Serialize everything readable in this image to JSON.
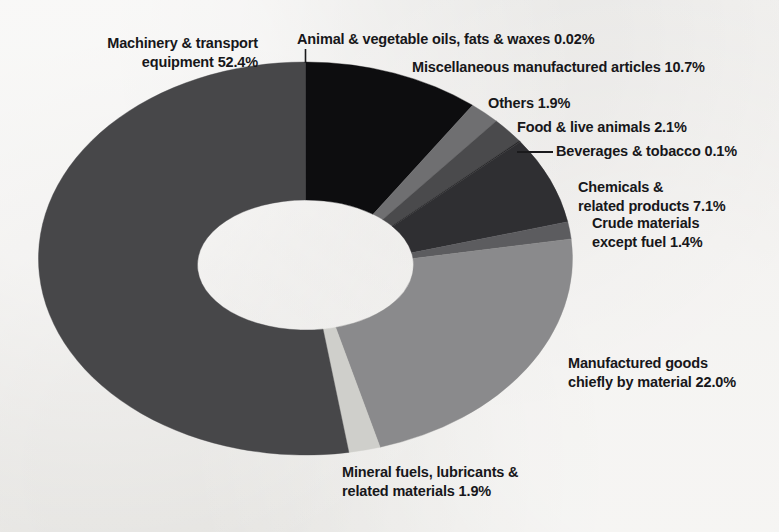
{
  "chart_data": {
    "type": "pie",
    "variant": "donut",
    "title": "",
    "subtitle": "",
    "xlabel": "",
    "ylabel": "",
    "units": "percent",
    "legend_position": "none",
    "grid": false,
    "labels_with_values": true,
    "categories": [
      "Animal & vegetable oils, fats & waxes",
      "Miscellaneous manufactured articles",
      "Others",
      "Food & live animals",
      "Beverages & tobacco",
      "Chemicals & related products",
      "Crude materials except fuel",
      "Manufactured goods chiefly by material",
      "Mineral fuels, lubricants & related materials",
      "Machinery & transport equipment"
    ],
    "values": [
      0.02,
      10.7,
      1.9,
      2.1,
      0.1,
      7.1,
      1.4,
      22.0,
      1.9,
      52.4
    ],
    "colors": [
      "#3b3b3d",
      "#0d0d0f",
      "#6f6f71",
      "#4a4a4c",
      "#262628",
      "#2f2f32",
      "#5c5c5f",
      "#8a8a8c",
      "#cfcfcb",
      "#474749"
    ],
    "slices": [
      {
        "key": "animal-oils",
        "label": "Animal & vegetable oils, fats & waxes",
        "value": 0.02,
        "value_text": "0.02%",
        "full_text": "Animal & vegetable oils, fats & waxes 0.02%",
        "color": "#3b3b3d",
        "leader": "vertical"
      },
      {
        "key": "misc-manufactured",
        "label": "Miscellaneous manufactured articles",
        "value": 10.7,
        "value_text": "10.7%",
        "full_text": "Miscellaneous manufactured articles 10.7%",
        "color": "#0d0d0f",
        "leader": "none"
      },
      {
        "key": "others",
        "label": "Others",
        "value": 1.9,
        "value_text": "1.9%",
        "full_text": "Others 1.9%",
        "color": "#6f6f71",
        "leader": "none"
      },
      {
        "key": "food-live-animals",
        "label": "Food & live animals",
        "value": 2.1,
        "value_text": "2.1%",
        "full_text": "Food & live animals 2.1%",
        "color": "#4a4a4c",
        "leader": "none"
      },
      {
        "key": "beverages-tobacco",
        "label": "Beverages & tobacco",
        "value": 0.1,
        "value_text": "0.1%",
        "full_text": "Beverages & tobacco 0.1%",
        "color": "#262628",
        "leader": "horizontal"
      },
      {
        "key": "chemicals",
        "label": "Chemicals & related products",
        "value": 7.1,
        "value_text": "7.1%",
        "line1": "Chemicals &",
        "line2": "related products 7.1%",
        "color": "#2f2f32",
        "leader": "none"
      },
      {
        "key": "crude-materials",
        "label": "Crude materials except fuel",
        "value": 1.4,
        "value_text": "1.4%",
        "line1": "Crude materials",
        "line2": "except fuel 1.4%",
        "color": "#5c5c5f",
        "leader": "none"
      },
      {
        "key": "manufactured-goods",
        "label": "Manufactured goods chiefly by material",
        "value": 22.0,
        "value_text": "22.0%",
        "line1": "Manufactured goods",
        "line2": "chiefly by material 22.0%",
        "color": "#8a8a8c",
        "leader": "none"
      },
      {
        "key": "mineral-fuels",
        "label": "Mineral fuels, lubricants & related materials",
        "value": 1.9,
        "value_text": "1.9%",
        "line1": "Mineral fuels, lubricants &",
        "line2": "related materials 1.9%",
        "color": "#cfcfcb",
        "leader": "none"
      },
      {
        "key": "machinery-transport",
        "label": "Machinery & transport equipment",
        "value": 52.4,
        "value_text": "52.4%",
        "line1": "Machinery & transport",
        "line2": "equipment 52.4%",
        "color": "#474749",
        "leader": "none"
      }
    ]
  },
  "labels": {
    "machinery_line1": "Machinery & transport",
    "machinery_line2": "equipment 52.4%",
    "animal_oils": "Animal & vegetable oils, fats & waxes 0.02%",
    "misc": "Miscellaneous manufactured articles 10.7%",
    "others": "Others 1.9%",
    "food": "Food & live animals 2.1%",
    "beverages": "Beverages & tobacco 0.1%",
    "chemicals_line1": "Chemicals &",
    "chemicals_line2": "related products 7.1%",
    "crude_line1": "Crude materials",
    "crude_line2": "except fuel 1.4%",
    "manufactured_line1": "Manufactured goods",
    "manufactured_line2": "chiefly by material 22.0%",
    "mineral_line1": "Mineral fuels, lubricants &",
    "mineral_line2": "related materials 1.9%"
  }
}
